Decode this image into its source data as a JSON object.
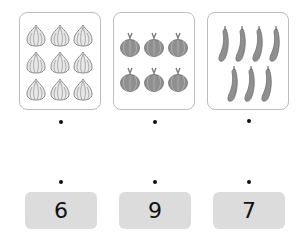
{
  "panels": [
    {
      "name": "garlic",
      "count": 9,
      "icon": "garlic-icon"
    },
    {
      "name": "onion",
      "count": 6,
      "icon": "onion-icon"
    },
    {
      "name": "cucumber",
      "count": 7,
      "icon": "cucumber-icon"
    }
  ],
  "numbers": [
    "6",
    "9",
    "7"
  ],
  "colors": {
    "panel_border": "#bdbdbd",
    "number_bg": "#dcdcdc",
    "veg": "#8f8f8f"
  }
}
